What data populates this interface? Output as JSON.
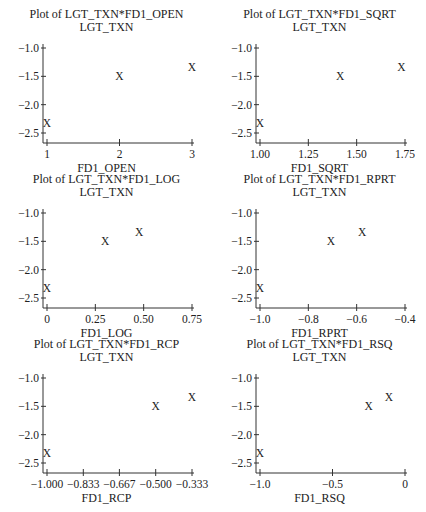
{
  "chart_data": [
    {
      "type": "scatter",
      "title": "Plot of LGT_TXN*FD1_OPEN",
      "ylabel": "LGT_TXN",
      "xlabel": "FD1_OPEN",
      "marker": "X",
      "x": [
        1,
        2,
        3
      ],
      "y": [
        -2.33,
        -1.5,
        -1.33
      ],
      "xlim": [
        1,
        3
      ],
      "ylim": [
        -2.6,
        -1.0
      ],
      "xticks": [
        1,
        2,
        3
      ],
      "xtick_labels": [
        "1",
        "2",
        "3"
      ],
      "yticks": [
        -1.0,
        -1.5,
        -2.0,
        -2.5
      ],
      "ytick_labels": [
        "−1.0",
        "−1.5",
        "−2.0",
        "−2.5"
      ]
    },
    {
      "type": "scatter",
      "title": "Plot of LGT_TXN*FD1_SQRT",
      "ylabel": "LGT_TXN",
      "xlabel": "FD1_SQRT",
      "marker": "X",
      "x": [
        1.0,
        1.414,
        1.732
      ],
      "y": [
        -2.33,
        -1.5,
        -1.33
      ],
      "xlim": [
        1.0,
        1.75
      ],
      "ylim": [
        -2.6,
        -1.0
      ],
      "xticks": [
        1.0,
        1.25,
        1.5,
        1.75
      ],
      "xtick_labels": [
        "1.00",
        "1.25",
        "1.50",
        "1.75"
      ],
      "yticks": [
        -1.0,
        -1.5,
        -2.0,
        -2.5
      ],
      "ytick_labels": [
        "−1.0",
        "−1.5",
        "−2.0",
        "−2.5"
      ]
    },
    {
      "type": "scatter",
      "title": "Plot of LGT_TXN*FD1_LOG",
      "ylabel": "LGT_TXN",
      "xlabel": "FD1_LOG",
      "marker": "X",
      "x": [
        0,
        0.301,
        0.477
      ],
      "y": [
        -2.33,
        -1.5,
        -1.33
      ],
      "xlim": [
        0,
        0.75
      ],
      "ylim": [
        -2.6,
        -1.0
      ],
      "xticks": [
        0,
        0.25,
        0.5,
        0.75
      ],
      "xtick_labels": [
        "0",
        "0.25",
        "0.50",
        "0.75"
      ],
      "yticks": [
        -1.0,
        -1.5,
        -2.0,
        -2.5
      ],
      "ytick_labels": [
        "−1.0",
        "−1.5",
        "−2.0",
        "−2.5"
      ]
    },
    {
      "type": "scatter",
      "title": "Plot of LGT_TXN*FD1_RPRT",
      "ylabel": "LGT_TXN",
      "xlabel": "FD1_RPRT",
      "marker": "X",
      "x": [
        -1.0,
        -0.707,
        -0.577
      ],
      "y": [
        -2.33,
        -1.5,
        -1.33
      ],
      "xlim": [
        -1.0,
        -0.4
      ],
      "ylim": [
        -2.6,
        -1.0
      ],
      "xticks": [
        -1.0,
        -0.8,
        -0.6,
        -0.4
      ],
      "xtick_labels": [
        "−1.0",
        "−0.8",
        "−0.6",
        "−0.4"
      ],
      "yticks": [
        -1.0,
        -1.5,
        -2.0,
        -2.5
      ],
      "ytick_labels": [
        "−1.0",
        "−1.5",
        "−2.0",
        "−2.5"
      ]
    },
    {
      "type": "scatter",
      "title": "Plot of LGT_TXN*FD1_RCP",
      "ylabel": "LGT_TXN",
      "xlabel": "FD1_RCP",
      "marker": "X",
      "x": [
        -1.0,
        -0.5,
        -0.333
      ],
      "y": [
        -2.33,
        -1.5,
        -1.33
      ],
      "xlim": [
        -1.0,
        -0.333
      ],
      "ylim": [
        -2.6,
        -1.0
      ],
      "xticks": [
        -1.0,
        -0.833,
        -0.667,
        -0.5,
        -0.333
      ],
      "xtick_labels": [
        "−1.000",
        "−0.833",
        "−0.667",
        "−0.500",
        "−0.333"
      ],
      "yticks": [
        -1.0,
        -1.5,
        -2.0,
        -2.5
      ],
      "ytick_labels": [
        "−1.0",
        "−1.5",
        "−2.0",
        "−2.5"
      ]
    },
    {
      "type": "scatter",
      "title": "Plot of LGT_TXN*FD1_RSQ",
      "ylabel": "LGT_TXN",
      "xlabel": "FD1_RSQ",
      "marker": "X",
      "x": [
        -1.0,
        -0.25,
        -0.111
      ],
      "y": [
        -2.33,
        -1.5,
        -1.33
      ],
      "xlim": [
        -1.0,
        0
      ],
      "ylim": [
        -2.6,
        -1.0
      ],
      "xticks": [
        -1.0,
        -0.5,
        0
      ],
      "xtick_labels": [
        "−1.0",
        "−0.5",
        "0"
      ],
      "yticks": [
        -1.0,
        -1.5,
        -2.0,
        -2.5
      ],
      "ytick_labels": [
        "−1.0",
        "−1.5",
        "−2.0",
        "−2.5"
      ]
    }
  ]
}
